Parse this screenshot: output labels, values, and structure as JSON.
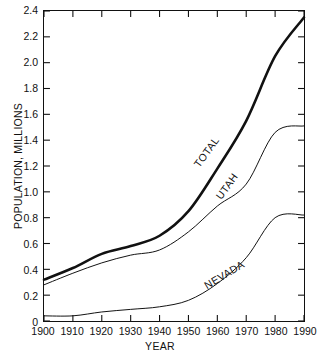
{
  "chart_data": {
    "type": "line",
    "title": "",
    "xlabel": "YEAR",
    "ylabel": "POPULATION, MILLIONS",
    "x": [
      1900,
      1910,
      1920,
      1930,
      1940,
      1950,
      1960,
      1970,
      1980,
      1990
    ],
    "xlim": [
      1900,
      1990
    ],
    "ylim": [
      0,
      2.4
    ],
    "xticks": [
      "1900",
      "1910",
      "1920",
      "1930",
      "1940",
      "1950",
      "1960",
      "1970",
      "1980",
      "1990"
    ],
    "yticks": [
      "0",
      "0.2",
      "0.4",
      "0.6",
      "0.8",
      "1.0",
      "1.2",
      "1.4",
      "1.6",
      "1.8",
      "2.0",
      "2.2",
      "2.4"
    ],
    "ytick_values": [
      0,
      0.2,
      0.4,
      0.6,
      0.8,
      1.0,
      1.2,
      1.4,
      1.6,
      1.8,
      2.0,
      2.2,
      2.4
    ],
    "grid": false,
    "legend": "inline-labels",
    "series": [
      {
        "name": "TOTAL",
        "label": "TOTAL",
        "color": "#111111",
        "width": 2.6,
        "values": [
          0.32,
          0.41,
          0.52,
          0.58,
          0.66,
          0.85,
          1.18,
          1.55,
          2.05,
          2.35
        ]
      },
      {
        "name": "UTAH",
        "label": "UTAH",
        "color": "#111111",
        "width": 1.0,
        "values": [
          0.28,
          0.37,
          0.45,
          0.51,
          0.55,
          0.69,
          0.89,
          1.06,
          1.46,
          1.51
        ]
      },
      {
        "name": "NEVADA",
        "label": "NEVADA",
        "color": "#111111",
        "width": 1.0,
        "values": [
          0.04,
          0.04,
          0.07,
          0.09,
          0.11,
          0.16,
          0.29,
          0.49,
          0.8,
          0.82
        ]
      }
    ]
  }
}
